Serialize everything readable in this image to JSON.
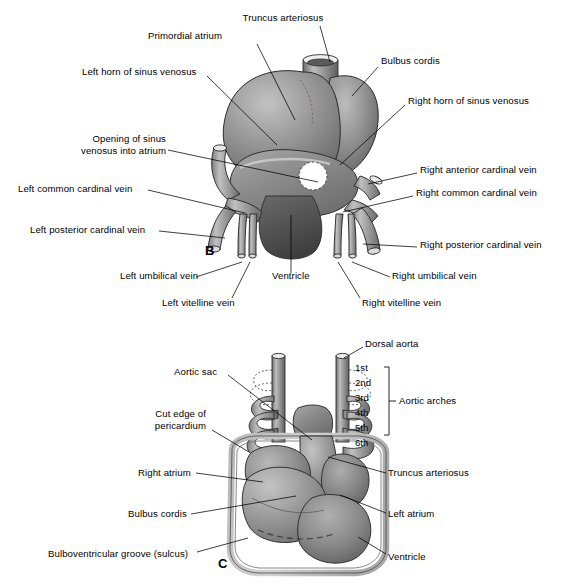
{
  "figure": {
    "panels": [
      {
        "letter": "B",
        "x": 205,
        "y": 243
      },
      {
        "letter": "C",
        "x": 218,
        "y": 563
      }
    ]
  },
  "panel_b": {
    "letter": "B",
    "labels": [
      {
        "id": "truncus-arteriosus",
        "text": "Truncus arteriosus",
        "x": 283,
        "y": 12,
        "align": "center",
        "leader": [
          [
            320,
            26
          ],
          [
            330,
            62
          ]
        ]
      },
      {
        "id": "primordial-atrium",
        "text": "Primordial atrium",
        "x": 185,
        "y": 30,
        "align": "center",
        "leader": [
          [
            257,
            44
          ],
          [
            295,
            120
          ]
        ]
      },
      {
        "id": "bulbus-cordis",
        "text": "Bulbus cordis",
        "x": 381,
        "y": 55,
        "align": "left",
        "leader": [
          [
            378,
            67
          ],
          [
            352,
            96
          ]
        ]
      },
      {
        "id": "left-horn-of-sinus-venosus",
        "text": "Left horn of sinus venosus",
        "x": 82,
        "y": 66,
        "align": "left",
        "leader": [
          [
            207,
            76
          ],
          [
            277,
            145
          ]
        ]
      },
      {
        "id": "right-horn-of-sinus-venosus",
        "text": "Right horn of sinus venosus",
        "x": 408,
        "y": 95,
        "align": "left",
        "leader": [
          [
            405,
            105
          ],
          [
            340,
            165
          ]
        ]
      },
      {
        "id": "opening-of-sinus-venosus-into-atrium",
        "text": "Opening of sinus\nvenosus into atrium",
        "x": 60,
        "y": 140,
        "align": "left",
        "leader": [
          [
            168,
            150
          ],
          [
            318,
            182
          ]
        ]
      },
      {
        "id": "right-anterior-cardinal-vein",
        "text": "Right anterior cardinal vein",
        "x": 420,
        "y": 164,
        "align": "left",
        "leader": [
          [
            417,
            173
          ],
          [
            368,
            184
          ]
        ]
      },
      {
        "id": "left-common-cardinal-vein",
        "text": "Left common cardinal vein",
        "x": 18,
        "y": 183,
        "align": "left",
        "leader": [
          [
            148,
            190
          ],
          [
            245,
            213
          ]
        ]
      },
      {
        "id": "right-common-cardinal-vein",
        "text": "Right common cardinal vein",
        "x": 416,
        "y": 187,
        "align": "left",
        "leader": [
          [
            413,
            196
          ],
          [
            343,
            212
          ]
        ]
      },
      {
        "id": "left-posterior-cardinal-vein",
        "text": "Left posterior cardinal vein",
        "x": 30,
        "y": 224,
        "align": "left",
        "leader": [
          [
            159,
            231
          ],
          [
            225,
            238
          ]
        ]
      },
      {
        "id": "right-posterior-cardinal-vein",
        "text": "Right posterior cardinal vein",
        "x": 420,
        "y": 239,
        "align": "left",
        "leader": [
          [
            417,
            247
          ],
          [
            363,
            244
          ]
        ]
      },
      {
        "id": "left-umbilical-vein",
        "text": "Left umbilical vein",
        "x": 120,
        "y": 275,
        "align": "left",
        "leader": [
          [
            196,
            277
          ],
          [
            242,
            262
          ]
        ]
      },
      {
        "id": "ventricle",
        "text": "Ventricle",
        "x": 272,
        "y": 275,
        "align": "center",
        "leader": [
          [
            291,
            273
          ],
          [
            291,
            215
          ]
        ]
      },
      {
        "id": "right-umbilical-vein",
        "text": "Right umbilical vein",
        "x": 392,
        "y": 275,
        "align": "left",
        "leader": [
          [
            390,
            277
          ],
          [
            352,
            262
          ]
        ]
      },
      {
        "id": "left-vitelline-vein",
        "text": "Left vitelline vein",
        "x": 162,
        "y": 300,
        "align": "left",
        "leader": [
          [
            232,
            298
          ],
          [
            250,
            262
          ]
        ]
      },
      {
        "id": "right-vitelline-vein",
        "text": "Right vitelline vein",
        "x": 362,
        "y": 300,
        "align": "left",
        "leader": [
          [
            360,
            298
          ],
          [
            338,
            262
          ]
        ]
      }
    ]
  },
  "panel_c": {
    "letter": "C",
    "arch_bracket_label": "Aortic arches",
    "arch_numbers": [
      "1st",
      "2nd",
      "3rd",
      "4th",
      "5th",
      "6th"
    ],
    "labels": [
      {
        "id": "dorsal-aorta",
        "text": "Dorsal aorta",
        "x": 365,
        "y": 338,
        "align": "left",
        "leader": [
          [
            363,
            347
          ],
          [
            344,
            358
          ]
        ]
      },
      {
        "id": "aortic-sac",
        "text": "Aortic sac",
        "x": 174,
        "y": 366,
        "align": "left",
        "leader": [
          [
            228,
            375
          ],
          [
            312,
            440
          ]
        ]
      },
      {
        "id": "cut-edge-of-pericardium",
        "text": "Cut edge of\npericardium",
        "x": 138,
        "y": 415,
        "align": "left",
        "leader": [
          [
            212,
            430
          ],
          [
            249,
            452
          ]
        ]
      },
      {
        "id": "right-atrium",
        "text": "Right atrium",
        "x": 138,
        "y": 467,
        "align": "left",
        "leader": [
          [
            196,
            473
          ],
          [
            263,
            482
          ]
        ]
      },
      {
        "id": "truncus-arteriosus-c",
        "text": "Truncus arteriosus",
        "x": 388,
        "y": 467,
        "align": "left",
        "leader": [
          [
            386,
            473
          ],
          [
            328,
            457
          ]
        ]
      },
      {
        "id": "bulbus-cordis-c",
        "text": "Bulbus cordis",
        "x": 128,
        "y": 508,
        "align": "left",
        "leader": [
          [
            191,
            514
          ],
          [
            296,
            496
          ]
        ]
      },
      {
        "id": "left-atrium",
        "text": "Left atrium",
        "x": 388,
        "y": 508,
        "align": "left",
        "leader": [
          [
            386,
            513
          ],
          [
            340,
            495
          ]
        ]
      },
      {
        "id": "bulboventricular-groove",
        "text": "Bulboventricular groove (sulcus)",
        "x": 48,
        "y": 548,
        "align": "left",
        "leader": [
          [
            197,
            552
          ],
          [
            248,
            538
          ]
        ]
      },
      {
        "id": "ventricle-c",
        "text": "Ventricle",
        "x": 388,
        "y": 551,
        "align": "left",
        "leader": [
          [
            386,
            554
          ],
          [
            358,
            537
          ]
        ]
      }
    ]
  },
  "colors": {
    "background": "#ffffff",
    "ink": "#000000",
    "tissue_light": "#b4b4b4",
    "tissue_mid": "#8c8c8c",
    "tissue_dark": "#6e6e6e",
    "tissue_darker": "#555555",
    "vessel": "#9a9a9a",
    "pericardium": "#c8c8c8",
    "highlight": "#d8d8d8",
    "opening": "#ffffff"
  }
}
